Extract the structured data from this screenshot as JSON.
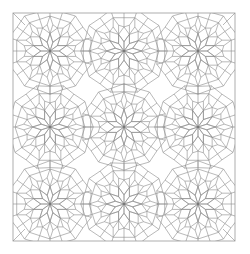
{
  "figure": {
    "width": 250,
    "height": 254,
    "frame": {
      "x": 13,
      "y": 13,
      "w": 222,
      "h": 228
    },
    "line_color": "#8a8a8a",
    "frame_color": "#9a9a9a",
    "background": "#ffffff",
    "grid": {
      "cols": 3,
      "rows": 3
    },
    "rosette_centers_x": [
      50,
      124,
      198
    ],
    "rosette_centers_y": [
      51,
      127,
      204
    ],
    "rosette_edge": 9.2
  }
}
